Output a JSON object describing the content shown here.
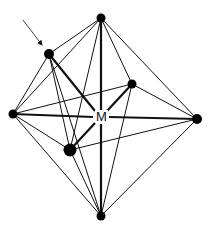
{
  "diagram": {
    "center": {
      "label": "M",
      "x": 101,
      "y": 117
    },
    "colors": {
      "line": "#111111",
      "vertex": "#000000",
      "background": "#ffffff"
    },
    "vertices": [
      {
        "id": "top",
        "x": 101,
        "y": 18,
        "r": 4.5
      },
      {
        "id": "a",
        "x": 49,
        "y": 54,
        "r": 5
      },
      {
        "id": "back",
        "x": 132,
        "y": 84,
        "r": 4.5
      },
      {
        "id": "left",
        "x": 13,
        "y": 114,
        "r": 4.5
      },
      {
        "id": "right",
        "x": 197,
        "y": 119,
        "r": 5
      },
      {
        "id": "front",
        "x": 70,
        "y": 150,
        "r": 6.5
      },
      {
        "id": "bottom",
        "x": 101,
        "y": 216,
        "r": 4.5
      }
    ],
    "arrow": {
      "from": [
        23,
        20
      ],
      "to": [
        43,
        47
      ],
      "points_to": "a"
    }
  }
}
